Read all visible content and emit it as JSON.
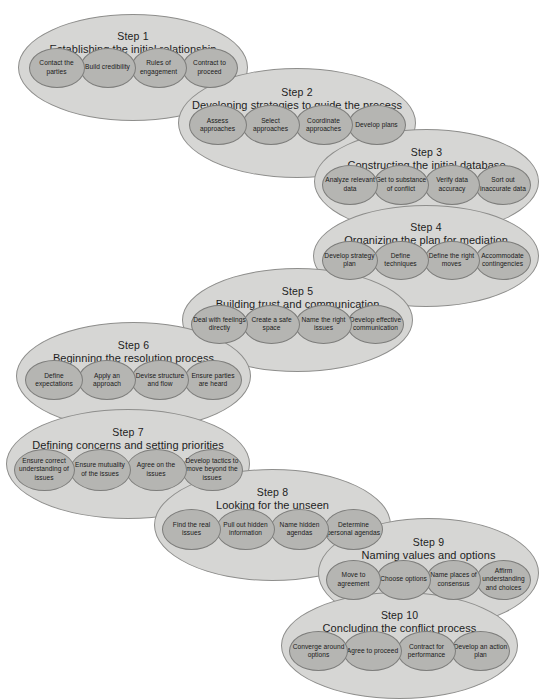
{
  "diagram": {
    "colors": {
      "outer_fill": "#d6d6d4",
      "outer_stroke": "#8e8e8c",
      "inner_fill": "#b5b5b2",
      "inner_stroke": "#7d7d7b",
      "text": "#1a1a1a",
      "background": "#ffffff"
    },
    "steps": [
      {
        "number": "Step 1",
        "label": "Establishing the initial relationship",
        "substeps": [
          "Contact the parties",
          "Build credibility",
          "Rules of engagement",
          "Contract to proceed"
        ]
      },
      {
        "number": "Step 2",
        "label": "Developing strategies to guide the process",
        "substeps": [
          "Assess approaches",
          "Select approaches",
          "Coordinate approaches",
          "Develop plans"
        ]
      },
      {
        "number": "Step 3",
        "label": "Constructing the initial database",
        "substeps": [
          "Analyze relevant data",
          "Get to substance of conflict",
          "Verify data accuracy",
          "Sort out inaccurate data"
        ]
      },
      {
        "number": "Step 4",
        "label": "Organizing the plan for mediation",
        "substeps": [
          "Develop strategy plan",
          "Define techniques",
          "Define the right moves",
          "Accommodate contingencies"
        ]
      },
      {
        "number": "Step 5",
        "label": "Building trust and communication",
        "substeps": [
          "Deal with feelings directly",
          "Create a safe space",
          "Name the right issues",
          "Develop effective communication"
        ]
      },
      {
        "number": "Step 6",
        "label": "Beginning the resolution process",
        "substeps": [
          "Define expectations",
          "Apply an approach",
          "Devise structure and flow",
          "Ensure parties are heard"
        ]
      },
      {
        "number": "Step 7",
        "label": "Defining concerns and setting priorities",
        "substeps": [
          "Ensure correct understanding of issues",
          "Ensure mutuality of the issues",
          "Agree on the issues",
          "Develop tactics to move beyond the issues"
        ]
      },
      {
        "number": "Step 8",
        "label": "Looking for the unseen",
        "substeps": [
          "Find the real issues",
          "Pull out hidden information",
          "Name hidden agendas",
          "Determine personal agendas"
        ]
      },
      {
        "number": "Step 9",
        "label": "Naming values and options",
        "substeps": [
          "Move to agreement",
          "Choose options",
          "Name places of consensus",
          "Affirm understanding and choices"
        ]
      },
      {
        "number": "Step 10",
        "label": "Concluding the conflict process",
        "substeps": [
          "Converge around options",
          "Agree to proceed",
          "Contract for performance",
          "Develop an action plan"
        ]
      }
    ]
  }
}
